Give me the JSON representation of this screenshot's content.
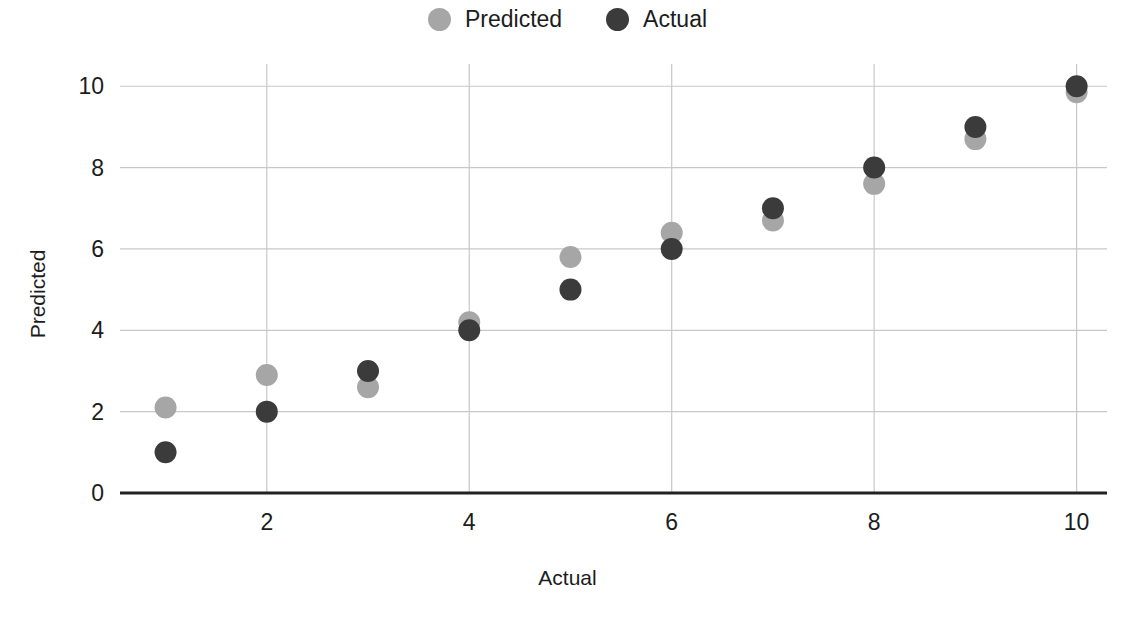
{
  "chart_data": {
    "type": "scatter",
    "title": "",
    "xlabel": "Actual",
    "ylabel": "Predicted",
    "x": [
      1,
      2,
      3,
      4,
      5,
      6,
      7,
      8,
      9,
      10
    ],
    "xlim": [
      0.55,
      10.3
    ],
    "ylim": [
      0,
      10.35
    ],
    "xticks": [
      2,
      4,
      6,
      8,
      10
    ],
    "xtick_labels": [
      "2",
      "4",
      "6",
      "8",
      "10"
    ],
    "yticks": [
      0,
      2,
      4,
      6,
      8,
      10
    ],
    "ytick_labels": [
      "0",
      "2",
      "4",
      "6",
      "8",
      "10"
    ],
    "grid": true,
    "grid_color": "#c8c8c8",
    "axis_color": "#222222",
    "legend_position": "top-center",
    "marker_radius": 11,
    "series": [
      {
        "name": "Predicted",
        "color": "#a6a6a6",
        "values": [
          2.1,
          2.9,
          2.6,
          4.2,
          5.8,
          6.4,
          6.7,
          7.6,
          8.7,
          9.85
        ]
      },
      {
        "name": "Actual",
        "color": "#3b3b3b",
        "values": [
          1.0,
          2.0,
          3.0,
          4.0,
          5.0,
          6.0,
          7.0,
          8.0,
          9.0,
          10.0
        ]
      }
    ]
  },
  "legend": {
    "entries": [
      {
        "label": "Predicted",
        "color": "#a6a6a6"
      },
      {
        "label": "Actual",
        "color": "#3b3b3b"
      }
    ]
  }
}
